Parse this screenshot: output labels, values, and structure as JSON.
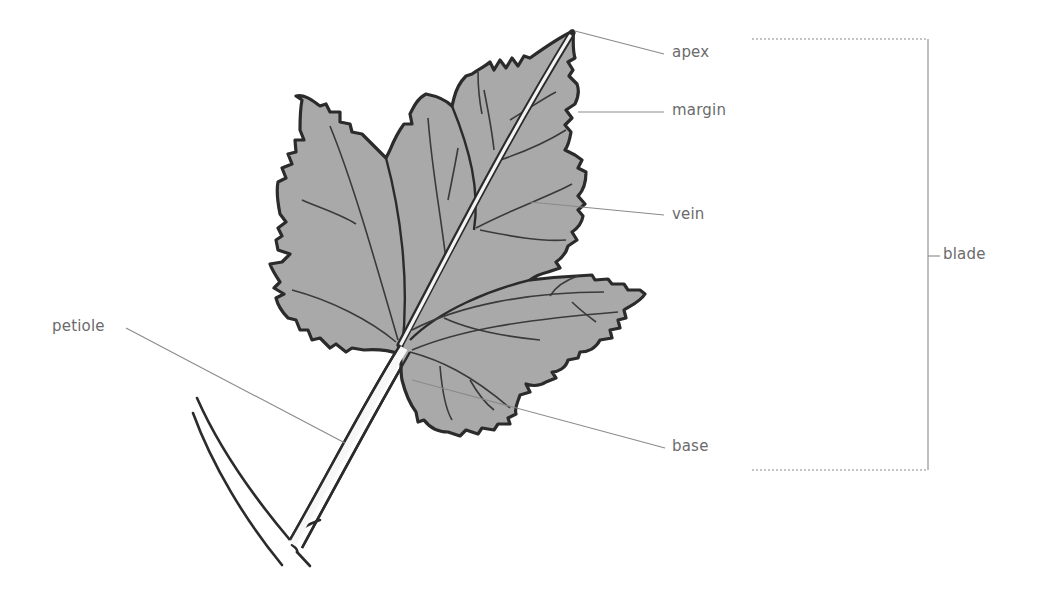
{
  "diagram": {
    "colors": {
      "leaf_fill": "#a9a9a9",
      "outline": "#2b2b2b",
      "leader_line": "#8a8a8a",
      "label_text": "#6b6b6b",
      "background": "#ffffff"
    },
    "labels": {
      "apex": "apex",
      "margin": "margin",
      "vein": "vein",
      "blade": "blade",
      "petiole": "petiole",
      "base": "base"
    }
  }
}
